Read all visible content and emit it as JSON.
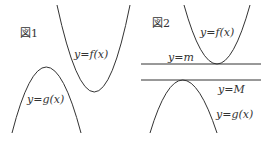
{
  "figures": [
    {
      "title": "図1",
      "curves": [
        {
          "name": "f",
          "label": "y=f(x)",
          "type": "upward-parabola"
        },
        {
          "name": "g",
          "label": "y=g(x)",
          "type": "downward-parabola"
        }
      ]
    },
    {
      "title": "図2",
      "curves": [
        {
          "name": "f",
          "label": "y=f(x)",
          "type": "upward-parabola"
        },
        {
          "name": "g",
          "label": "y=g(x)",
          "type": "downward-parabola"
        }
      ],
      "lines": [
        {
          "name": "m",
          "label": "y=m"
        },
        {
          "name": "M",
          "label": "y=M"
        }
      ]
    }
  ]
}
